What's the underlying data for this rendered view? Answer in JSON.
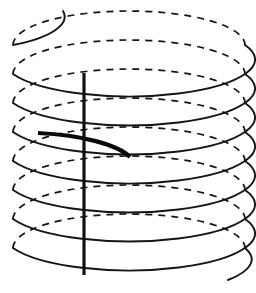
{
  "figure": {
    "canvas": {
      "width": 256,
      "height": 293,
      "background": "#ffffff"
    }
  },
  "geometry": {
    "center_x": 129,
    "radius_x": 116,
    "radius_y": 34,
    "turn_count": 8,
    "top_y": 45,
    "pitch": 29,
    "left_edge_x": 13,
    "right_edge_x": 245
  },
  "style": {
    "stroke_color": "#141414",
    "back_stroke_width": 1.7,
    "front_stroke_width": 1.9,
    "dash_pattern": "7 6",
    "axis_color": "#111111",
    "axis_stroke_width": 3.2,
    "highlight_color": "#0a0a0a",
    "highlight_stroke_width": 4.2
  },
  "elements": {
    "axis": {
      "name": "vertical axis line",
      "x": 84,
      "y_top": 73,
      "y_bottom": 275
    },
    "highlight": {
      "name": "bold arc segment",
      "start_x": 38,
      "start_y": 133,
      "end_x": 130,
      "end_y": 157
    },
    "lead_in": {
      "name": "top open end of helix",
      "end_x": 63,
      "end_y": 11
    },
    "lead_out": {
      "name": "bottom open end of helix",
      "end_x": 228,
      "end_y": 280
    }
  },
  "chart_data": {
    "type": "line",
    "xlabel": "",
    "ylabel": "",
    "series": [
      {
        "name": "helix",
        "parametrization": "x = cx + rx*cos(t), y = cy0 + ry*sin(t) + pitch*t/(2*pi)",
        "cx": 129,
        "rx": 116,
        "ry": 34,
        "pitch": 29,
        "t_start_deg": 160,
        "t_end_deg": 3040,
        "turns": 8
      }
    ],
    "annotations": [
      {
        "label": "vertical axis line",
        "x": 84,
        "y_from": 73,
        "y_to": 275
      },
      {
        "label": "bold highlighted turn segment",
        "x_from": 38,
        "y_from": 133,
        "x_to": 130,
        "y_to": 157
      }
    ],
    "grid": false,
    "legend": "none"
  }
}
